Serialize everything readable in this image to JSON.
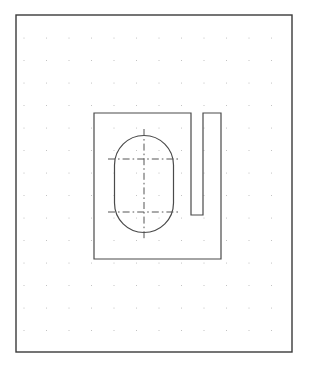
{
  "canvas": {
    "name": "sketch-canvas",
    "width": 310,
    "height": 369,
    "background_color": "#ffffff"
  },
  "border": {
    "label": "drawing-frame",
    "x": 16,
    "y": 15,
    "width": 276,
    "height": 337,
    "stroke_color": "#3a3a3a",
    "stroke_width": 1.4,
    "fill": "none"
  },
  "grid": {
    "label": "dot-grid",
    "visible": true,
    "spacing": 22.5,
    "origin_x": 24,
    "origin_y": 38,
    "columns": 12,
    "rows": 14,
    "dot_color": "#b9b9b9",
    "dot_radius": 0.55
  },
  "geometry": {
    "stroke_color": "#4a4a4a",
    "stroke_width": 1.2,
    "fill": "none",
    "profile": {
      "label": "main-profile-outline",
      "description": "rectangular body with narrow vertical slot cut from top edge near right side",
      "points": [
        [
          94,
          113
        ],
        [
          191,
          113
        ],
        [
          191,
          215
        ],
        [
          203,
          215
        ],
        [
          203,
          113
        ],
        [
          221,
          113
        ],
        [
          221,
          259
        ],
        [
          94,
          259
        ]
      ],
      "closed": true
    },
    "narrow_slot": {
      "label": "narrow-vertical-slot",
      "left_x": 191,
      "right_x": 203,
      "top_y": 113,
      "bottom_y": 215,
      "width": 12,
      "depth": 102
    },
    "obround": {
      "label": "obround-slot",
      "center_x": 144,
      "center_y": 184,
      "width": 59,
      "height": 97,
      "radius": 29.5,
      "left_x": 114.5,
      "right_x": 173.5,
      "top_y": 135.5,
      "bottom_y": 232.5,
      "straight_top_y": 165,
      "straight_bottom_y": 203
    }
  },
  "centerlines": {
    "label": "construction-centerlines",
    "stroke_color": "#555555",
    "stroke_width": 1.0,
    "dash_pattern": "7 3 1.6 3",
    "vertical": {
      "label": "vertical-centerline",
      "x": 144,
      "y1": 129,
      "y2": 240
    },
    "horizontal_upper": {
      "label": "upper-horizontal-centerline",
      "y": 159,
      "x1": 108,
      "x2": 180
    },
    "horizontal_lower": {
      "label": "lower-horizontal-centerline",
      "y": 212,
      "x1": 108,
      "x2": 180
    }
  }
}
